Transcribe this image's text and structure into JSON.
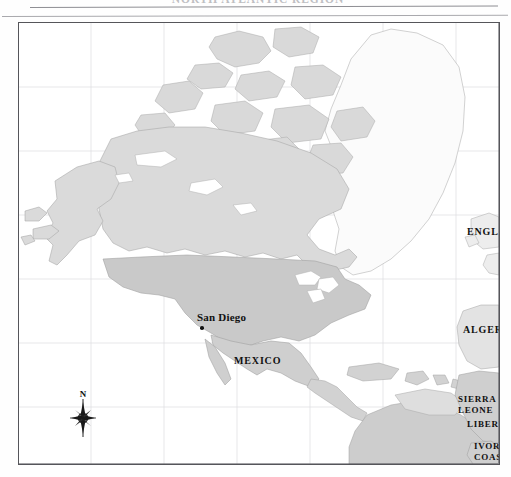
{
  "page": {
    "header_text": "NORTH ATLANTIC REGION",
    "figure_type": "reference map"
  },
  "map": {
    "frame": {
      "border_color": "#55555a",
      "background": "#ffffff"
    },
    "graticule": {
      "visible": true,
      "color": "#dcdce0"
    },
    "land_colors": {
      "united_states": "#c9c9c9",
      "canada": "#dadada",
      "arctic_islands": "#d9d9d9",
      "greenland": "#fbfbfb",
      "mexico": "#cfcfcf",
      "central_america": "#d2d2d2",
      "south_america": "#cdcdcd",
      "europe": "#ededed",
      "africa": "#e3e3e3",
      "lakes": "#ffffff"
    },
    "labels": [
      {
        "id": "san-diego",
        "text": "San Diego",
        "style": "city",
        "x": 196,
        "y": 316,
        "marker": true
      },
      {
        "id": "mexico",
        "text": "MEXICO",
        "style": "country",
        "x": 233,
        "y": 357,
        "marker": false
      },
      {
        "id": "england",
        "text": "ENGLAN",
        "style": "country",
        "x": 466,
        "y": 228,
        "marker": false,
        "truncated": true
      },
      {
        "id": "algeria",
        "text": "ALGERIA",
        "style": "country",
        "x": 462,
        "y": 326,
        "marker": false,
        "truncated": true
      },
      {
        "id": "sierra-leone",
        "text": "SIERRA\nLEONE",
        "style": "small",
        "x": 457,
        "y": 395,
        "marker": false,
        "leader": true
      },
      {
        "id": "liberia",
        "text": "LIBERIA",
        "style": "small",
        "x": 466,
        "y": 419,
        "marker": false,
        "leader": true
      },
      {
        "id": "ivory-coast",
        "text": "IVORY\nCOAST",
        "style": "small",
        "x": 473,
        "y": 441,
        "marker": false
      }
    ],
    "label_text": {
      "san_diego": "San Diego",
      "mexico": "MEXICO",
      "england": "ENGLAN",
      "algeria": "ALGERIA",
      "sierra_leone_line1": "SIERRA",
      "sierra_leone_line2": "LEONE",
      "liberia": "LIBERIA",
      "ivory_coast_line1": "IVORY",
      "ivory_coast_line2": "COAST"
    },
    "compass": {
      "north_label": "N",
      "x": 83,
      "y": 414,
      "points": 8
    }
  }
}
